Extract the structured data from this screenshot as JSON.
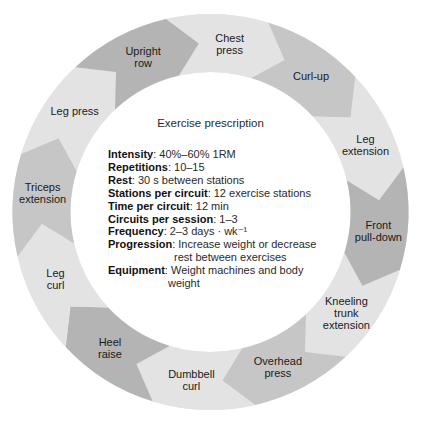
{
  "diagram": {
    "title": "Exercise prescription",
    "colors": {
      "light": "#e3e3e3",
      "medium": "#c6c6c6",
      "dark": "#b4b4b4",
      "text": "#1a1a1a"
    },
    "stations": [
      {
        "lines": [
          "Chest",
          "press"
        ],
        "shade": "light"
      },
      {
        "lines": [
          "Curl-up"
        ],
        "shade": "medium"
      },
      {
        "lines": [
          "Leg",
          "extension"
        ],
        "shade": "light"
      },
      {
        "lines": [
          "Front",
          "pull-down"
        ],
        "shade": "dark"
      },
      {
        "lines": [
          "Kneeling",
          "trunk",
          "extension"
        ],
        "shade": "light"
      },
      {
        "lines": [
          "Overhead",
          "press"
        ],
        "shade": "medium"
      },
      {
        "lines": [
          "Dumbbell",
          "curl"
        ],
        "shade": "light"
      },
      {
        "lines": [
          "Heel",
          "raise"
        ],
        "shade": "dark"
      },
      {
        "lines": [
          "Leg",
          "curl"
        ],
        "shade": "light"
      },
      {
        "lines": [
          "Triceps",
          "extension"
        ],
        "shade": "medium"
      },
      {
        "lines": [
          "Leg press"
        ],
        "shade": "light"
      },
      {
        "lines": [
          "Upright",
          "row"
        ],
        "shade": "dark"
      }
    ],
    "prescription": [
      {
        "key": "Intensity",
        "value": ": 40%–60% 1RM"
      },
      {
        "key": "Repetitions",
        "value": ": 10–15"
      },
      {
        "key": "Rest",
        "value": ": 30 s between stations"
      },
      {
        "key": "Stations per circuit",
        "value": ": 12 exercise stations"
      },
      {
        "key": "Time per circuit",
        "value": ": 12 min"
      },
      {
        "key": "Circuits per session",
        "value": ": 1–3"
      },
      {
        "key": "Frequency",
        "value": ": 2–3 days · wk⁻¹"
      },
      {
        "key": "Progression",
        "value": ": Increase weight or decrease",
        "cont": "rest between exercises"
      },
      {
        "key": "Equipment",
        "value": ": Weight machines and body",
        "cont": "weight"
      }
    ]
  }
}
